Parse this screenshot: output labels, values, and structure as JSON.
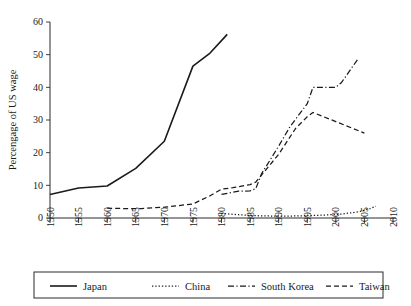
{
  "chart_data": {
    "type": "line",
    "title": "",
    "xlabel": "",
    "ylabel": "Percengage of US wage",
    "xlim": [
      1950,
      2010
    ],
    "ylim": [
      0,
      60
    ],
    "grid": false,
    "legend_position": "bottom",
    "x_ticks": [
      "1950",
      "1955",
      "1960",
      "1965",
      "1970",
      "1975",
      "1980",
      "1985",
      "1990",
      "1995",
      "2000",
      "2005",
      "2010"
    ],
    "y_ticks": [
      "0",
      "10",
      "20",
      "30",
      "40",
      "50",
      "60"
    ],
    "series": [
      {
        "name": "Japan",
        "style": "solid",
        "x": [
          1950,
          1955,
          1960,
          1965,
          1970,
          1975,
          1978,
          1981
        ],
        "values": [
          7.2,
          9.2,
          9.8,
          15.2,
          23.5,
          46.5,
          50.5,
          56.2
        ]
      },
      {
        "name": "China",
        "style": "dotted",
        "x": [
          1980,
          1983,
          1986,
          1989,
          1992,
          1995,
          1998,
          2001,
          2004,
          2006,
          2007
        ],
        "values": [
          1.4,
          1.0,
          0.7,
          0.6,
          0.6,
          0.7,
          0.9,
          1.2,
          1.9,
          2.9,
          3.6
        ]
      },
      {
        "name": "South Korea",
        "style": "dashdot",
        "x": [
          1980,
          1983,
          1985,
          1986,
          1987,
          1990,
          1992,
          1995,
          1996,
          2000,
          2001,
          2004
        ],
        "values": [
          7.2,
          8.2,
          8.3,
          9.0,
          13.5,
          22.0,
          28.0,
          35.0,
          40.0,
          40.0,
          41.5,
          49.0
        ]
      },
      {
        "name": "Taiwan",
        "style": "dashed",
        "x": [
          1960,
          1963,
          1966,
          1970,
          1975,
          1978,
          1980,
          1982,
          1985,
          1986,
          1990,
          1993,
          1995,
          1996,
          2000,
          2005
        ],
        "values": [
          3.0,
          2.9,
          2.9,
          3.3,
          4.3,
          6.8,
          8.8,
          9.3,
          10.2,
          11.0,
          19.5,
          27.5,
          31.0,
          32.3,
          29.5,
          26.0
        ]
      }
    ]
  },
  "legend": {
    "items": [
      {
        "label": "Japan",
        "style": "solid"
      },
      {
        "label": "China",
        "style": "dotted"
      },
      {
        "label": "South Korea",
        "style": "dashdot"
      },
      {
        "label": "Taiwan",
        "style": "dashed"
      }
    ]
  }
}
